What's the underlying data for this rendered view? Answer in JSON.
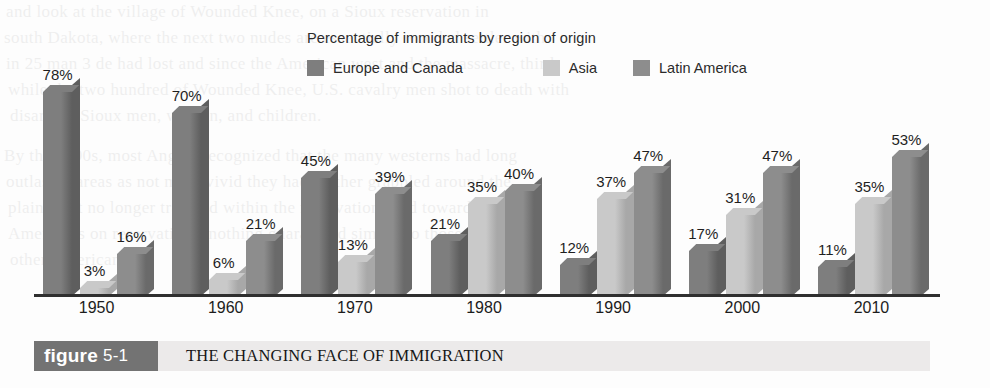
{
  "figure": {
    "tag_word": "figure",
    "tag_number": "5-1",
    "caption": "THE CHANGING FACE OF IMMIGRATION",
    "tag_bg": "#737373",
    "bar_bg": "#eceaea"
  },
  "chart_data": {
    "type": "bar",
    "title": "Percentage of immigrants by region of origin",
    "xlabel": "",
    "ylabel": "",
    "ylim": [
      0,
      80
    ],
    "grid": false,
    "legend_position": "top",
    "categories": [
      "1950",
      "1960",
      "1970",
      "1980",
      "1990",
      "2000",
      "2010"
    ],
    "series": [
      {
        "name": "Europe and Canada",
        "color": "#7e7e7e",
        "side_color": "#5e5e5e",
        "values": [
          78,
          70,
          45,
          21,
          12,
          17,
          11
        ],
        "labels": [
          "78%",
          "70%",
          "45%",
          "21%",
          "12%",
          "17%",
          "11%"
        ]
      },
      {
        "name": "Asia",
        "color": "#c9c9c9",
        "side_color": "#a8a8a8",
        "values": [
          3,
          6,
          13,
          35,
          37,
          31,
          35
        ],
        "labels": [
          "3%",
          "6%",
          "13%",
          "35%",
          "37%",
          "31%",
          "35%"
        ]
      },
      {
        "name": "Latin America",
        "color": "#8d8d8d",
        "side_color": "#6a6a6a",
        "values": [
          16,
          21,
          39,
          40,
          47,
          47,
          53
        ],
        "labels": [
          "16%",
          "21%",
          "39%",
          "40%",
          "47%",
          "47%",
          "53%"
        ]
      }
    ]
  },
  "ghost_text": [
    {
      "x": 6,
      "y": 2,
      "size": 17,
      "text": "and look at the village of Wounded Knee, on a Sioux reservation in"
    },
    {
      "x": 4,
      "y": 28,
      "size": 17,
      "text": "south Dakota, where the next two nudes are essentially wooded settler with"
    },
    {
      "x": 6,
      "y": 54,
      "size": 17,
      "text": "in 25 man 3 de had lost and since the American west and the massacre, third"
    },
    {
      "x": 8,
      "y": 80,
      "size": 17,
      "text": "while the two hundred of Wounded Knee, U.S. cavalry men shot to death with"
    },
    {
      "x": 10,
      "y": 106,
      "size": 17,
      "text": "disarmed Sioux men, women, and children."
    },
    {
      "x": 4,
      "y": 146,
      "size": 17,
      "text": "By the 1890s, most Anglos recognized that the many westerns had long"
    },
    {
      "x": 6,
      "y": 172,
      "size": 17,
      "text": "outlasted areas as not more vivid they had neither grappled around the"
    },
    {
      "x": 8,
      "y": 198,
      "size": 17,
      "text": "plains that no longer traveled within the reservations and toward their"
    },
    {
      "x": 8,
      "y": 224,
      "size": 17,
      "text": "Americans on reservations, nothing guaranteed similar to those owned by"
    },
    {
      "x": 10,
      "y": 250,
      "size": 17,
      "text": "other Americans."
    }
  ]
}
